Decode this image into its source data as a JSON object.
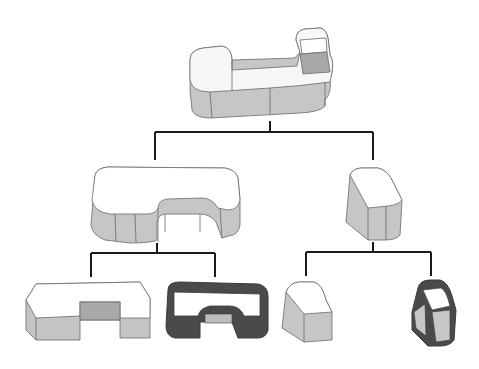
{
  "diagram": {
    "type": "tree",
    "colors": {
      "background": "#ffffff",
      "connector": "#1a1a1a",
      "top_face": "#ffffff",
      "side_face": "#c4c4c4",
      "edge": "#6a6a6a",
      "highlight_fillet": "#4a4a4a"
    },
    "nodes": [
      {
        "id": "root",
        "label": "",
        "shape": "full-part-with-boss"
      },
      {
        "id": "left",
        "label": "",
        "shape": "u-notched-block-with-fillets",
        "parent": "root"
      },
      {
        "id": "right",
        "label": "",
        "shape": "small-rounded-block",
        "parent": "root"
      },
      {
        "id": "left-a",
        "label": "",
        "shape": "u-notched-block-plain",
        "parent": "left"
      },
      {
        "id": "left-b",
        "label": "",
        "shape": "u-notched-block-fillet-highlighted",
        "parent": "left"
      },
      {
        "id": "right-a",
        "label": "",
        "shape": "small-block-plain",
        "parent": "right"
      },
      {
        "id": "right-b",
        "label": "",
        "shape": "small-block-fillet-highlighted",
        "parent": "right"
      }
    ]
  }
}
